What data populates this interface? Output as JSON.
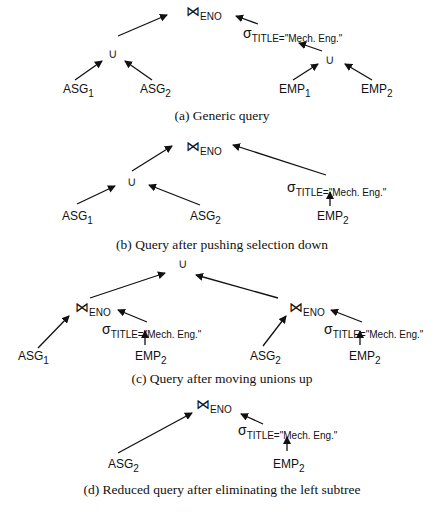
{
  "symbols": {
    "join": "⋈",
    "union": "∪",
    "select": "σ"
  },
  "labels": {
    "eno": "ENO",
    "predicate": "TITLE=\"Mech. Eng.\"",
    "asg": "ASG",
    "emp": "EMP",
    "one": "1",
    "two": "2"
  },
  "panels": [
    {
      "id": "a",
      "caption": "(a) Generic query"
    },
    {
      "id": "b",
      "caption": "(b) Query after pushing selection down"
    },
    {
      "id": "c",
      "caption": "(c) Query after moving unions up"
    },
    {
      "id": "d",
      "caption": "(d) Reduced query after eliminating the left subtree"
    }
  ],
  "arrow_color": "#111111"
}
